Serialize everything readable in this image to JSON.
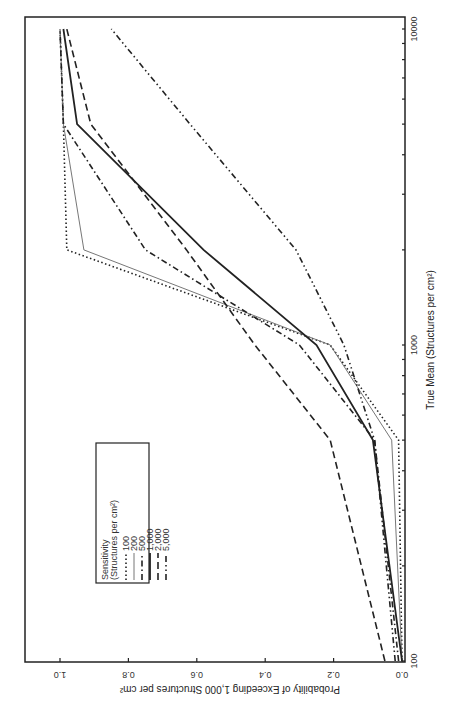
{
  "chart_data": {
    "type": "line",
    "orientation": "rotated 90deg (x-axis runs vertically along right edge, y-axis along bottom, text upside-down)",
    "title": "",
    "xlabel": "True Mean (Structures per cm²)",
    "ylabel": "Probability of Exceeding 1,000 Structures per cm²",
    "xscale": "log",
    "xlim": [
      100,
      10000
    ],
    "ylim": [
      0.0,
      1.0
    ],
    "x_tick_labels": [
      "100",
      "1000",
      "10000"
    ],
    "y_tick_labels": [
      "0.0",
      "0.2",
      "0.4",
      "0.6",
      "0.8",
      "1.0"
    ],
    "grid": false,
    "legend": {
      "title": "Sensitivity",
      "subtitle": "(Structures per cm²)",
      "position": "upper-left inside plot (in rotated view, lower-left area of image)"
    },
    "x": [
      100,
      500,
      1000,
      2000,
      5000,
      10000
    ],
    "series": [
      {
        "name": "100",
        "style": "dotted",
        "values": [
          0.0,
          0.01,
          0.21,
          0.98,
          0.99,
          1.0
        ]
      },
      {
        "name": "200",
        "style": "thin-gray-solid",
        "values": [
          0.0,
          0.03,
          0.21,
          0.93,
          0.99,
          1.0
        ]
      },
      {
        "name": "500",
        "style": "dash-dot",
        "values": [
          0.01,
          0.08,
          0.3,
          0.75,
          0.99,
          1.0
        ]
      },
      {
        "name": "1,000",
        "style": "thick-solid",
        "values": [
          0.0,
          0.085,
          0.25,
          0.58,
          0.95,
          0.99
        ]
      },
      {
        "name": "2,000",
        "style": "dashed",
        "values": [
          0.05,
          0.21,
          0.43,
          0.63,
          0.91,
          0.98
        ]
      },
      {
        "name": "5,000",
        "style": "dash-dot-dot",
        "values": [
          0.02,
          0.08,
          0.17,
          0.31,
          0.62,
          0.85
        ]
      }
    ]
  },
  "legend": {
    "title": "Sensitivity",
    "subtitle": "(Structures per cm²)",
    "items": [
      "100",
      "200",
      "500",
      "1,000",
      "2,000",
      "5,000"
    ]
  },
  "axes": {
    "x_title": "True Mean (Structures per cm²)",
    "y_title": "Probability of Exceeding 1,000 Structures per cm²"
  }
}
